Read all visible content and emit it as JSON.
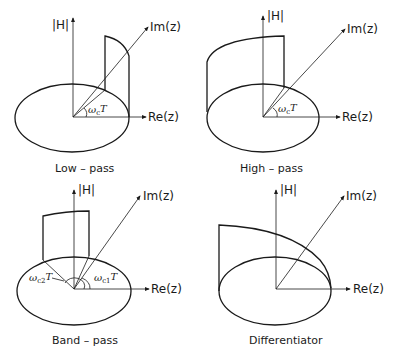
{
  "figure": {
    "axis_labels": {
      "magnitude": "|H|",
      "real": "Re(z)",
      "imag": "Im(z)"
    },
    "panels": [
      {
        "id": "low-pass",
        "caption": "Low – pass",
        "angles": [
          {
            "symbol": "ω",
            "subscript": "c",
            "suffix": "T"
          }
        ]
      },
      {
        "id": "high-pass",
        "caption": "High – pass",
        "angles": [
          {
            "symbol": "ω",
            "subscript": "c",
            "suffix": "T"
          }
        ]
      },
      {
        "id": "band-pass",
        "caption": "Band – pass",
        "angles": [
          {
            "symbol": "ω",
            "subscript": "c2",
            "suffix": "T"
          },
          {
            "symbol": "ω",
            "subscript": "c1",
            "suffix": "T"
          }
        ]
      },
      {
        "id": "differentiator",
        "caption": "Differentiator",
        "angles": []
      }
    ]
  }
}
